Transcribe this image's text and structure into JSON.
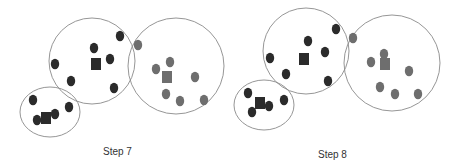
{
  "steps": [
    {
      "label": "Step 7",
      "label_pos": [
        103,
        146
      ],
      "clusters": [
        {
          "name": "cluster-small",
          "shape": "ellipse",
          "cx": 50,
          "cy": 112,
          "rx": 30,
          "ry": 25,
          "color": "#2b2b2b",
          "centroid": [
            46,
            118
          ],
          "points": [
            [
              33,
              100
            ],
            [
              37,
              120
            ],
            [
              55,
              114
            ],
            [
              69,
              107
            ]
          ]
        },
        {
          "name": "cluster-middle",
          "shape": "circle",
          "cx": 92,
          "cy": 61,
          "r": 43,
          "color": "#2b2b2b",
          "centroid": [
            96,
            64
          ],
          "points": [
            [
              94,
              48
            ],
            [
              110,
              59
            ],
            [
              120,
              36
            ],
            [
              55,
              64
            ],
            [
              71,
              81
            ],
            [
              114,
              88
            ]
          ]
        },
        {
          "name": "cluster-right",
          "shape": "circle",
          "cx": 176,
          "cy": 66,
          "r": 48,
          "color": "#6e6e6e",
          "centroid": [
            167,
            77
          ],
          "points": [
            [
              138,
              45
            ],
            [
              170,
              62
            ],
            [
              156,
              69
            ],
            [
              195,
              77
            ],
            [
              166,
              94
            ],
            [
              180,
              101
            ],
            [
              204,
              100
            ]
          ]
        }
      ]
    },
    {
      "label": "Step 8",
      "label_pos": [
        318,
        149
      ],
      "clusters": [
        {
          "name": "cluster-small",
          "shape": "ellipse",
          "cx": 264,
          "cy": 105,
          "rx": 30,
          "ry": 25,
          "color": "#2b2b2b",
          "centroid": [
            260,
            103
          ],
          "points": [
            [
              248,
              93
            ],
            [
              252,
              112
            ],
            [
              269,
              106
            ],
            [
              284,
              100
            ]
          ]
        },
        {
          "name": "cluster-middle",
          "shape": "circle",
          "cx": 306,
          "cy": 51,
          "r": 43,
          "color": "#2b2b2b",
          "centroid": [
            304,
            59
          ],
          "points": [
            [
              308,
              41
            ],
            [
              325,
              52
            ],
            [
              336,
              29
            ],
            [
              270,
              58
            ],
            [
              286,
              74
            ],
            [
              328,
              81
            ]
          ]
        },
        {
          "name": "cluster-right",
          "shape": "circle",
          "cx": 392,
          "cy": 63,
          "r": 48,
          "color": "#6e6e6e",
          "centroid": [
            385,
            64
          ],
          "points": [
            [
              353,
              38
            ],
            [
              384,
              54
            ],
            [
              371,
              62
            ],
            [
              409,
              71
            ],
            [
              380,
              87
            ],
            [
              395,
              94
            ],
            [
              418,
              94
            ]
          ]
        }
      ]
    }
  ],
  "style": {
    "outline_color": "#8a8a8a",
    "dark_point_color": "#2b2b2b",
    "gray_point_color": "#6e6e6e"
  }
}
